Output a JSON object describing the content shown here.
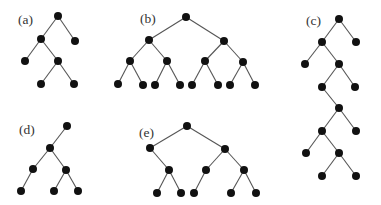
{
  "diagram": {
    "type": "binary-tree-figure",
    "node_radius": 4,
    "colors": {
      "node": "#111111",
      "edge": "#555555",
      "label": "#333333",
      "background": "#ffffff"
    },
    "trees": [
      {
        "id": "a",
        "label": "(a)",
        "label_pos": [
          18,
          24
        ],
        "nodes": [
          [
            58,
            16
          ],
          [
            41,
            39
          ],
          [
            75,
            41
          ],
          [
            25,
            61
          ],
          [
            58,
            61
          ],
          [
            41,
            84
          ],
          [
            74,
            84
          ]
        ],
        "edges": [
          [
            0,
            1
          ],
          [
            0,
            2
          ],
          [
            1,
            3
          ],
          [
            1,
            4
          ],
          [
            4,
            5
          ],
          [
            4,
            6
          ]
        ]
      },
      {
        "id": "b",
        "label": "(b)",
        "label_pos": [
          140,
          23
        ],
        "nodes": [
          [
            186,
            17
          ],
          [
            149,
            40
          ],
          [
            224,
            41
          ],
          [
            130,
            61
          ],
          [
            167,
            61
          ],
          [
            205,
            61
          ],
          [
            243,
            62
          ],
          [
            118,
            84
          ],
          [
            143,
            85
          ],
          [
            155,
            85
          ],
          [
            180,
            85
          ],
          [
            192,
            85
          ],
          [
            218,
            85
          ],
          [
            230,
            85
          ],
          [
            255,
            85
          ]
        ],
        "edges": [
          [
            0,
            1
          ],
          [
            0,
            2
          ],
          [
            1,
            3
          ],
          [
            1,
            4
          ],
          [
            2,
            5
          ],
          [
            2,
            6
          ],
          [
            3,
            7
          ],
          [
            3,
            8
          ],
          [
            4,
            9
          ],
          [
            4,
            10
          ],
          [
            5,
            11
          ],
          [
            5,
            12
          ],
          [
            6,
            13
          ],
          [
            6,
            14
          ]
        ]
      },
      {
        "id": "c",
        "label": "(c)",
        "label_pos": [
          306,
          25
        ],
        "nodes": [
          [
            339,
            19
          ],
          [
            322,
            42
          ],
          [
            356,
            42
          ],
          [
            305,
            64
          ],
          [
            339,
            64
          ],
          [
            322,
            87
          ],
          [
            355,
            87
          ],
          [
            339,
            108
          ],
          [
            322,
            131
          ],
          [
            356,
            131
          ],
          [
            306,
            153
          ],
          [
            339,
            153
          ],
          [
            322,
            176
          ],
          [
            356,
            176
          ]
        ],
        "edges": [
          [
            0,
            1
          ],
          [
            0,
            2
          ],
          [
            1,
            3
          ],
          [
            1,
            4
          ],
          [
            4,
            5
          ],
          [
            4,
            6
          ],
          [
            5,
            7
          ],
          [
            7,
            8
          ],
          [
            7,
            9
          ],
          [
            8,
            10
          ],
          [
            8,
            11
          ],
          [
            11,
            12
          ],
          [
            11,
            13
          ]
        ]
      },
      {
        "id": "d",
        "label": "(d)",
        "label_pos": [
          19,
          134
        ],
        "nodes": [
          [
            67,
            126
          ],
          [
            50,
            148
          ],
          [
            33,
            169
          ],
          [
            66,
            170
          ],
          [
            21,
            191
          ],
          [
            54,
            191
          ],
          [
            78,
            191
          ]
        ],
        "edges": [
          [
            0,
            1
          ],
          [
            1,
            2
          ],
          [
            1,
            3
          ],
          [
            2,
            4
          ],
          [
            3,
            5
          ],
          [
            3,
            6
          ]
        ]
      },
      {
        "id": "e",
        "label": "(e)",
        "label_pos": [
          139,
          137
        ],
        "nodes": [
          [
            187,
            126
          ],
          [
            150,
            148
          ],
          [
            225,
            149
          ],
          [
            169,
            170
          ],
          [
            206,
            170
          ],
          [
            244,
            170
          ],
          [
            157,
            193
          ],
          [
            181,
            193
          ],
          [
            194,
            193
          ],
          [
            231,
            193
          ],
          [
            256,
            193
          ]
        ],
        "edges": [
          [
            0,
            1
          ],
          [
            0,
            2
          ],
          [
            1,
            3
          ],
          [
            2,
            4
          ],
          [
            2,
            5
          ],
          [
            3,
            6
          ],
          [
            3,
            7
          ],
          [
            4,
            8
          ],
          [
            5,
            9
          ],
          [
            5,
            10
          ]
        ]
      }
    ]
  }
}
